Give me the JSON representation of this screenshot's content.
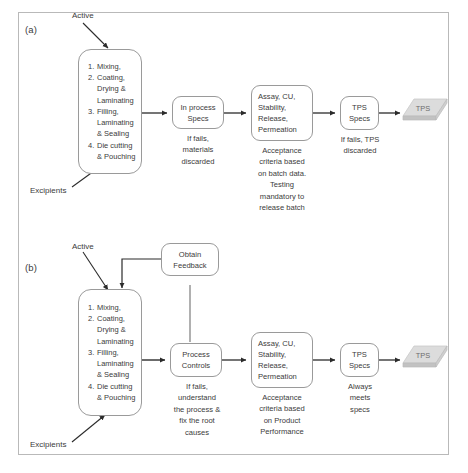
{
  "figure": {
    "panels": [
      {
        "id": "a",
        "label": "(a)",
        "inputs": {
          "active": "Active",
          "excipients": "Excipients"
        },
        "nodes": {
          "manufacturing": {
            "name": "manufacturing-steps",
            "steps": [
              {
                "num": "1.",
                "lines": [
                  "Mixing,"
                ]
              },
              {
                "num": "2.",
                "lines": [
                  "Coating,",
                  "Drying  &",
                  "Laminating"
                ]
              },
              {
                "num": "3.",
                "lines": [
                  "Filling,",
                  "Laminating",
                  "& Sealing"
                ]
              },
              {
                "num": "4.",
                "lines": [
                  "Die cutting",
                  "& Pouching"
                ]
              }
            ]
          },
          "inprocess": {
            "title": "In process\nSpecs",
            "caption": "If fails,\nmaterials\ndiscarded"
          },
          "testing": {
            "title": "Assay, CU,\nStability,\nRelease,\nPermeation",
            "caption": "Acceptance\ncriteria based\non batch data.\nTesting\nmandatory to\nrelease batch"
          },
          "tpsspecs": {
            "title": "TPS\nSpecs",
            "caption": "If fails, TPS\ndiscarded"
          },
          "product": {
            "label": "TPS"
          }
        }
      },
      {
        "id": "b",
        "label": "(b)",
        "inputs": {
          "active": "Active",
          "excipients": "Excipients"
        },
        "nodes": {
          "feedback": {
            "title": "Obtain\nFeedback"
          },
          "manufacturing": {
            "name": "manufacturing-steps",
            "steps": [
              {
                "num": "1.",
                "lines": [
                  "Mixing,"
                ]
              },
              {
                "num": "2.",
                "lines": [
                  "Coating,",
                  "Drying  &",
                  "Laminating"
                ]
              },
              {
                "num": "3.",
                "lines": [
                  "Filling,",
                  "Laminating",
                  "& Sealing"
                ]
              },
              {
                "num": "4.",
                "lines": [
                  "Die cutting",
                  "& Pouching"
                ]
              }
            ]
          },
          "processcontrols": {
            "title": "Process\nControls",
            "caption": "If fails,\nunderstand\nthe process &\nfix the root\ncauses"
          },
          "testing": {
            "title": "Assay, CU,\nStability,\nRelease,\nPermeation",
            "caption": "Acceptance\ncriteria based\non Product\nPerformance"
          },
          "tpsspecs": {
            "title": "TPS\nSpecs",
            "caption": "Always\nmeets\nspecs"
          },
          "product": {
            "label": "TPS"
          }
        }
      }
    ],
    "colors": {
      "frame_border": "#b9b9b9",
      "node_border": "#9a9a9a",
      "text": "#3b3b3b",
      "arrow": "#2b2b2b",
      "slab_top": "#d9d9d9",
      "slab_side": "#bdbdbd"
    }
  }
}
